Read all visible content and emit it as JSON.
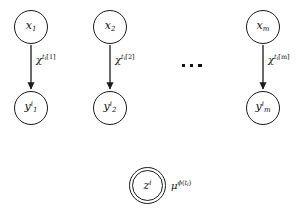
{
  "diagram": {
    "type": "probabilistic-graphical-model",
    "background_color": "#ffffff",
    "stroke_color": "#1a1a1a",
    "text_color": "#111111",
    "columns": [
      {
        "id": "column-1",
        "parent_node": {
          "symbol": "x",
          "subscript": "1",
          "superscript": ""
        },
        "child_node": {
          "symbol": "y",
          "subscript": "1",
          "superscript": "i"
        },
        "edge_label": {
          "base": "χ",
          "sup_base": "t",
          "sup_sub": "i",
          "sup_index": "[1]"
        }
      },
      {
        "id": "column-2",
        "parent_node": {
          "symbol": "x",
          "subscript": "2",
          "superscript": ""
        },
        "child_node": {
          "symbol": "y",
          "subscript": "2",
          "superscript": "i"
        },
        "edge_label": {
          "base": "χ",
          "sup_base": "t",
          "sup_sub": "i",
          "sup_index": "[2]"
        }
      },
      {
        "id": "column-m",
        "parent_node": {
          "symbol": "x",
          "subscript": "m",
          "superscript": ""
        },
        "child_node": {
          "symbol": "y",
          "subscript": "m",
          "superscript": "i"
        },
        "edge_label": {
          "base": "χ",
          "sup_base": "t",
          "sup_sub": "i",
          "sup_index": "[m]"
        }
      }
    ],
    "ellipsis": {
      "dot_count": 3
    },
    "observed_node": {
      "symbol": "z",
      "superscript": "i",
      "side_label": {
        "base": "μ",
        "sup_base": "ϕ",
        "sup_arg_open": "(",
        "sup_arg": "t",
        "sup_arg_sub": "i",
        "sup_arg_close": ")"
      }
    }
  }
}
